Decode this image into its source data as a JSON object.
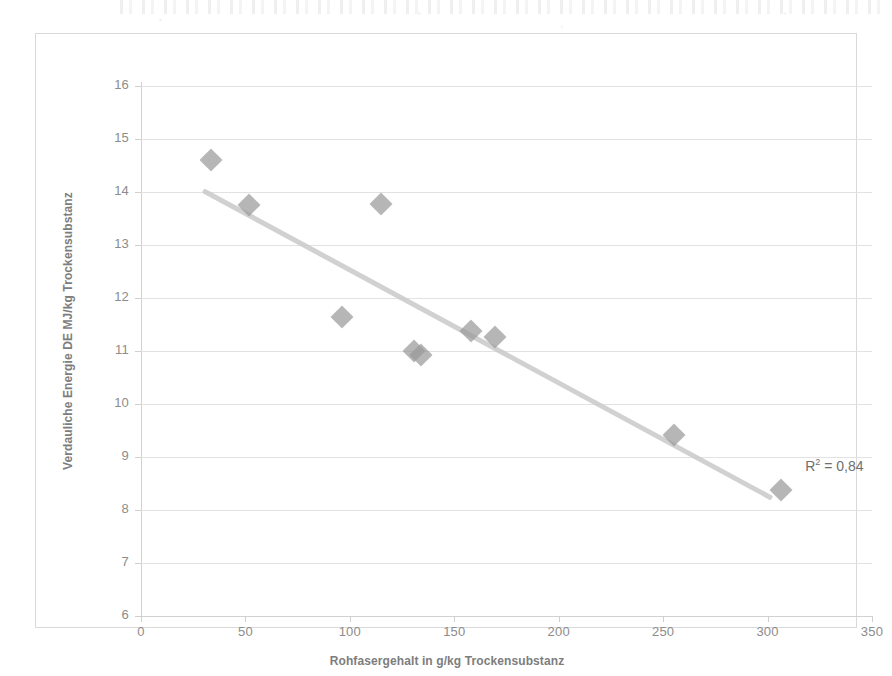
{
  "chart_data": {
    "type": "scatter",
    "title": "",
    "xlabel": "Rohfasergehalt in g/kg Trockensubstanz",
    "ylabel": "Verdauliche Energie DE MJ/kg Trockensubstanz",
    "xlim": [
      0,
      350
    ],
    "ylim": [
      6,
      16
    ],
    "xticks": [
      0,
      50,
      100,
      150,
      200,
      250,
      300,
      350
    ],
    "yticks": [
      6,
      7,
      8,
      9,
      10,
      11,
      12,
      13,
      14,
      15,
      16
    ],
    "grid": "horizontal",
    "legend": "none",
    "series": [
      {
        "name": "Messwerte",
        "marker": "diamond",
        "color": "#9a9a9a",
        "points": [
          {
            "x": 33.5,
            "y": 14.6
          },
          {
            "x": 51.5,
            "y": 13.75
          },
          {
            "x": 96.0,
            "y": 11.65
          },
          {
            "x": 115.0,
            "y": 13.78
          },
          {
            "x": 130.5,
            "y": 11.0
          },
          {
            "x": 134.0,
            "y": 10.92
          },
          {
            "x": 158.0,
            "y": 11.38
          },
          {
            "x": 169.5,
            "y": 11.27
          },
          {
            "x": 255.0,
            "y": 9.42
          },
          {
            "x": 306.5,
            "y": 8.38
          }
        ]
      }
    ],
    "trendline": {
      "type": "linear",
      "color": "#c9c9c9",
      "x_start": 29.5,
      "y_start": 14.02,
      "x_end": 302.0,
      "y_end": 8.21
    },
    "annotations": [
      {
        "name": "r-squared",
        "base_text": "R",
        "sup_text": "2",
        "tail_text": " = 0,84",
        "full_text": "R² = 0,84",
        "x": 318.0,
        "y": 8.83
      }
    ]
  },
  "colors": {
    "marker": "#9a9a9a",
    "trendline": "#c9c9c9",
    "gridline": "#e2e2e2",
    "axis_text": "#8c8c8c",
    "title_text": "#7d7d7d",
    "frame": "#d9d9d9",
    "background": "#ffffff"
  }
}
